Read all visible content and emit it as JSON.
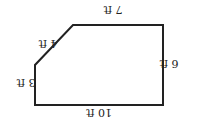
{
  "diagram": {
    "type": "pentagon-floor-plan",
    "orientation": "rotated 180 degrees",
    "stroke_color": "#222222",
    "background": "#ffffff",
    "sides": [
      {
        "id": "top",
        "label": "7 ft"
      },
      {
        "id": "right",
        "label": "6 ft"
      },
      {
        "id": "bottom",
        "label": "10 ft"
      },
      {
        "id": "left",
        "label": "3 ft"
      },
      {
        "id": "diagonal",
        "label": "4 ft"
      }
    ]
  }
}
